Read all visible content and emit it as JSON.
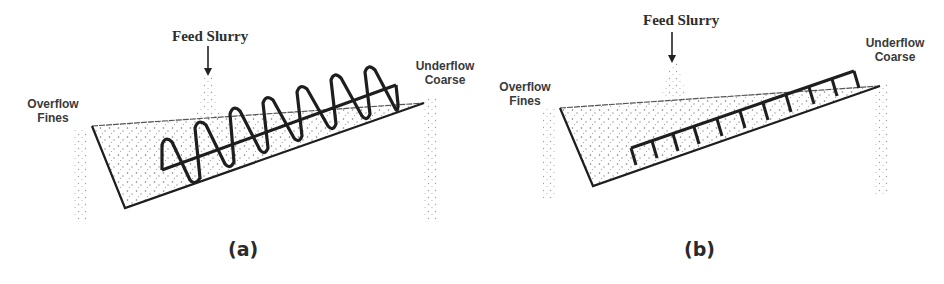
{
  "panels": [
    {
      "id": "a",
      "type": "spiral-classifier",
      "caption": "(a)",
      "labels": {
        "feed": "Feed Slurry",
        "overflow_line1": "Overflow",
        "overflow_line2": "Fines",
        "underflow_line1": "Underflow",
        "underflow_line2": "Coarse"
      }
    },
    {
      "id": "b",
      "type": "rake-classifier",
      "caption": "(b)",
      "labels": {
        "feed": "Feed Slurry",
        "overflow_line1": "Overflow",
        "overflow_line2": "Fines",
        "underflow_line1": "Underflow",
        "underflow_line2": "Coarse"
      }
    }
  ],
  "colors": {
    "line": "#1e1e1e",
    "stipple": "#8a8a8a",
    "text": "#3a3a3a"
  }
}
